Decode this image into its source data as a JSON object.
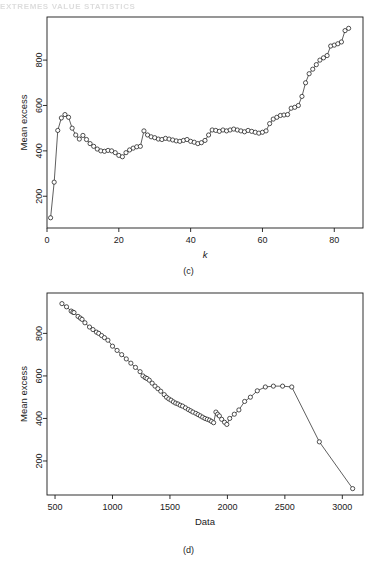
{
  "page": {
    "scan_header_text": "EXTREMES  VALUE  STATISTICS",
    "background": "#ffffff",
    "ink_color": "#1a1a1a"
  },
  "figures": [
    {
      "id": "panel-c",
      "caption": "(c)",
      "ylabel": "Mean excess",
      "xlabel": "k",
      "xlabel_style": "italic"
    },
    {
      "id": "panel-d",
      "caption": "(d)",
      "ylabel": "Mean excess",
      "xlabel": "Data",
      "xlabel_style": "normal"
    }
  ],
  "chart_data": [
    {
      "type": "scatter",
      "id": "panel-c",
      "title": "",
      "subtitle": "",
      "caption": "(c)",
      "xlabel": "k",
      "ylabel": "Mean excess",
      "grid": false,
      "legend": false,
      "marker": "open-circle",
      "connected": true,
      "xlim": [
        0,
        88
      ],
      "ylim": [
        60,
        990
      ],
      "xticks": [
        0,
        20,
        40,
        60,
        80
      ],
      "yticks": [
        200,
        400,
        600,
        800
      ],
      "xticklabels": [
        "0",
        "20",
        "40",
        "60",
        "80"
      ],
      "yticklabels": [
        "200",
        "400",
        "600",
        "800"
      ],
      "x": [
        1,
        2,
        3,
        4,
        5,
        6,
        7,
        8,
        9,
        10,
        11,
        12,
        13,
        14,
        15,
        16,
        17,
        18,
        19,
        20,
        21,
        22,
        23,
        24,
        25,
        26,
        27,
        28,
        29,
        30,
        31,
        32,
        33,
        34,
        35,
        36,
        37,
        38,
        39,
        40,
        41,
        42,
        43,
        44,
        45,
        46,
        47,
        48,
        49,
        50,
        51,
        52,
        53,
        54,
        55,
        56,
        57,
        58,
        59,
        60,
        61,
        62,
        63,
        64,
        65,
        66,
        67,
        68,
        69,
        70,
        71,
        72,
        73,
        74,
        75,
        76,
        77,
        78,
        79,
        80,
        81,
        82,
        83,
        84
      ],
      "y": [
        105,
        262,
        490,
        545,
        560,
        548,
        500,
        470,
        452,
        468,
        450,
        432,
        420,
        408,
        400,
        398,
        402,
        400,
        392,
        380,
        374,
        392,
        404,
        412,
        418,
        420,
        488,
        470,
        462,
        458,
        452,
        450,
        455,
        452,
        448,
        444,
        442,
        446,
        450,
        442,
        438,
        432,
        436,
        446,
        470,
        492,
        490,
        486,
        492,
        488,
        492,
        496,
        492,
        488,
        484,
        490,
        486,
        482,
        478,
        482,
        488,
        520,
        540,
        548,
        556,
        558,
        560,
        588,
        592,
        600,
        640,
        700,
        740,
        760,
        780,
        800,
        810,
        820,
        862,
        866,
        872,
        880,
        930,
        940
      ],
      "series": [
        {
          "name": "mean excess vs k",
          "values": [
            105,
            262,
            490,
            545,
            560,
            548,
            500,
            470,
            452,
            468,
            450,
            432,
            420,
            408,
            400,
            398,
            402,
            400,
            392,
            380,
            374,
            392,
            404,
            412,
            418,
            420,
            488,
            470,
            462,
            458,
            452,
            450,
            455,
            452,
            448,
            444,
            442,
            446,
            450,
            442,
            438,
            432,
            436,
            446,
            470,
            492,
            490,
            486,
            492,
            488,
            492,
            496,
            492,
            488,
            484,
            490,
            486,
            482,
            478,
            482,
            488,
            520,
            540,
            548,
            556,
            558,
            560,
            588,
            592,
            600,
            640,
            700,
            740,
            760,
            780,
            800,
            810,
            820,
            862,
            866,
            872,
            880,
            930,
            940
          ]
        }
      ]
    },
    {
      "type": "scatter",
      "id": "panel-d",
      "title": "",
      "subtitle": "",
      "caption": "(d)",
      "xlabel": "Data",
      "ylabel": "Mean excess",
      "grid": false,
      "legend": false,
      "marker": "open-circle",
      "connected": true,
      "xlim": [
        430,
        3180
      ],
      "ylim": [
        40,
        990
      ],
      "xticks": [
        500,
        1000,
        1500,
        2000,
        2500,
        3000
      ],
      "yticks": [
        200,
        400,
        600,
        800
      ],
      "xticklabels": [
        "500",
        "1000",
        "1500",
        "2000",
        "2500",
        "3000"
      ],
      "yticklabels": [
        "200",
        "400",
        "600",
        "800"
      ],
      "x": [
        560,
        600,
        640,
        655,
        665,
        700,
        720,
        735,
        760,
        800,
        830,
        860,
        880,
        905,
        930,
        960,
        1000,
        1040,
        1080,
        1120,
        1160,
        1200,
        1240,
        1265,
        1285,
        1300,
        1320,
        1345,
        1370,
        1395,
        1420,
        1450,
        1470,
        1490,
        1510,
        1530,
        1550,
        1570,
        1590,
        1610,
        1635,
        1660,
        1680,
        1700,
        1725,
        1745,
        1765,
        1785,
        1805,
        1825,
        1845,
        1862,
        1880,
        1900,
        1915,
        1930,
        1950,
        1975,
        1995,
        2020,
        2060,
        2100,
        2150,
        2200,
        2260,
        2330,
        2400,
        2480,
        2560,
        2800,
        3090
      ],
      "y": [
        940,
        925,
        905,
        900,
        898,
        880,
        872,
        866,
        850,
        830,
        818,
        806,
        800,
        790,
        780,
        768,
        740,
        720,
        700,
        680,
        660,
        640,
        620,
        600,
        592,
        588,
        580,
        566,
        552,
        540,
        528,
        512,
        500,
        492,
        486,
        478,
        472,
        468,
        462,
        458,
        450,
        442,
        436,
        430,
        424,
        418,
        412,
        406,
        400,
        396,
        392,
        386,
        380,
        430,
        420,
        412,
        396,
        382,
        372,
        400,
        420,
        440,
        480,
        500,
        530,
        548,
        552,
        552,
        548,
        290,
        70
      ],
      "series": [
        {
          "name": "mean excess vs data threshold",
          "values": [
            940,
            925,
            905,
            900,
            898,
            880,
            872,
            866,
            850,
            830,
            818,
            806,
            800,
            790,
            780,
            768,
            740,
            720,
            700,
            680,
            660,
            640,
            620,
            600,
            592,
            588,
            580,
            566,
            552,
            540,
            528,
            512,
            500,
            492,
            486,
            478,
            472,
            468,
            462,
            458,
            450,
            442,
            436,
            430,
            424,
            418,
            412,
            406,
            400,
            396,
            392,
            386,
            380,
            430,
            420,
            412,
            396,
            382,
            372,
            400,
            420,
            440,
            480,
            500,
            530,
            548,
            552,
            552,
            548,
            290,
            70
          ]
        }
      ]
    }
  ]
}
